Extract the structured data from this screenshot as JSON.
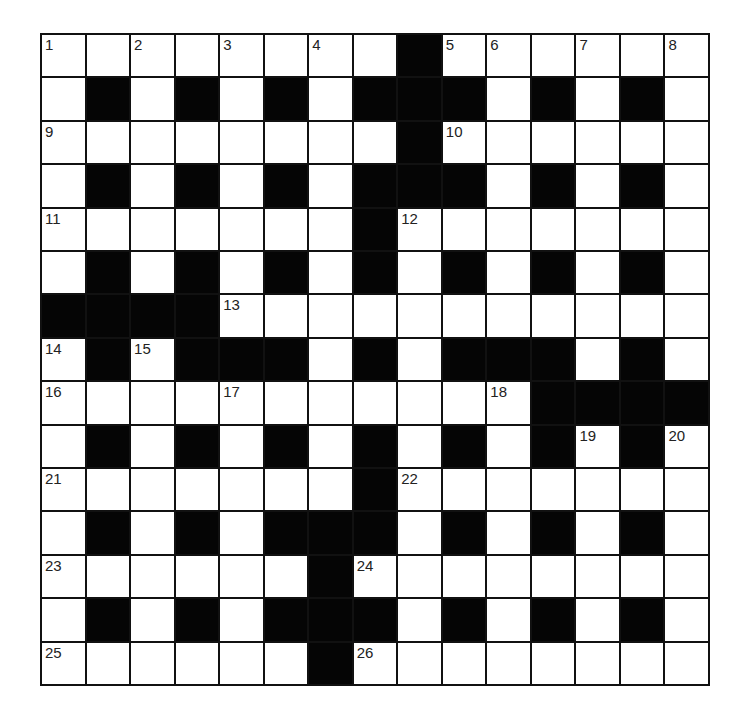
{
  "puzzle": {
    "type": "crossword",
    "rows": 15,
    "cols": 15,
    "colors": {
      "block": "#050505",
      "cell": "#ffffff",
      "border": "#111111",
      "number": "#222222"
    },
    "layout": [
      "........#......",
      ".#.#.#.###.#.#.",
      "........#......",
      ".#.#.#.###.#.#.",
      ".......#.......",
      ".#.#.#.#.#.#.#.",
      "####...........",
      ".#.###.#.###.#.",
      "...........####",
      ".#.#.#.#.#.#.#.",
      ".......#.......",
      ".#.#.###.#.#.#.",
      "......#........",
      ".#.#.###.#.#.#.",
      "......#........"
    ],
    "numbers": [
      {
        "r": 0,
        "c": 0,
        "n": "1"
      },
      {
        "r": 0,
        "c": 2,
        "n": "2"
      },
      {
        "r": 0,
        "c": 4,
        "n": "3"
      },
      {
        "r": 0,
        "c": 6,
        "n": "4"
      },
      {
        "r": 0,
        "c": 9,
        "n": "5"
      },
      {
        "r": 0,
        "c": 10,
        "n": "6"
      },
      {
        "r": 0,
        "c": 12,
        "n": "7"
      },
      {
        "r": 0,
        "c": 14,
        "n": "8"
      },
      {
        "r": 2,
        "c": 0,
        "n": "9"
      },
      {
        "r": 2,
        "c": 9,
        "n": "10"
      },
      {
        "r": 4,
        "c": 0,
        "n": "11"
      },
      {
        "r": 4,
        "c": 8,
        "n": "12"
      },
      {
        "r": 6,
        "c": 4,
        "n": "13"
      },
      {
        "r": 7,
        "c": 0,
        "n": "14"
      },
      {
        "r": 7,
        "c": 2,
        "n": "15"
      },
      {
        "r": 8,
        "c": 0,
        "n": "16"
      },
      {
        "r": 8,
        "c": 4,
        "n": "17"
      },
      {
        "r": 8,
        "c": 10,
        "n": "18"
      },
      {
        "r": 9,
        "c": 12,
        "n": "19"
      },
      {
        "r": 9,
        "c": 14,
        "n": "20"
      },
      {
        "r": 10,
        "c": 0,
        "n": "21"
      },
      {
        "r": 10,
        "c": 8,
        "n": "22"
      },
      {
        "r": 12,
        "c": 0,
        "n": "23"
      },
      {
        "r": 12,
        "c": 7,
        "n": "24"
      },
      {
        "r": 14,
        "c": 0,
        "n": "25"
      },
      {
        "r": 14,
        "c": 7,
        "n": "26"
      }
    ]
  }
}
